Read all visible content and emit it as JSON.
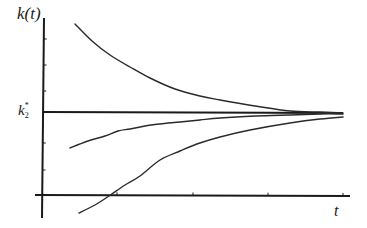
{
  "chart_data": {
    "type": "line",
    "title": "",
    "xlabel": "t",
    "ylabel": "k(t)",
    "reference_line": {
      "label_base": "k",
      "label_sub": "2",
      "label_sup": "*",
      "y_pixel": 112
    },
    "grid": false,
    "legend": null,
    "axis": {
      "x_axis": {
        "x1": 35,
        "y1": 195,
        "x2": 350,
        "y2": 196
      },
      "y_axis": {
        "x1": 44,
        "y1": 18,
        "x2": 42,
        "y2": 218
      },
      "x_ticks_px": [
        117,
        193,
        268,
        343
      ],
      "y_ticks_px": [
        39,
        65,
        91,
        143,
        170
      ]
    },
    "series": [
      {
        "name": "above-steady-state path",
        "points_px": [
          [
            75,
            24
          ],
          [
            92,
            41
          ],
          [
            110,
            55
          ],
          [
            130,
            67
          ],
          [
            150,
            78
          ],
          [
            175,
            89
          ],
          [
            200,
            96
          ],
          [
            220,
            100
          ],
          [
            255,
            106
          ],
          [
            290,
            111
          ],
          [
            320,
            112
          ],
          [
            343,
            113
          ]
        ]
      },
      {
        "name": "below-steady-state path (near)",
        "points_px": [
          [
            70,
            148
          ],
          [
            88,
            141
          ],
          [
            105,
            136
          ],
          [
            118,
            131
          ],
          [
            130,
            129
          ],
          [
            145,
            126
          ],
          [
            160,
            124
          ],
          [
            180,
            122
          ],
          [
            200,
            120
          ],
          [
            220,
            118
          ],
          [
            255,
            116
          ],
          [
            290,
            115
          ],
          [
            320,
            114
          ],
          [
            343,
            114
          ]
        ]
      },
      {
        "name": "below-steady-state path (far)",
        "points_px": [
          [
            79,
            213
          ],
          [
            95,
            205
          ],
          [
            109,
            196
          ],
          [
            125,
            185
          ],
          [
            140,
            176
          ],
          [
            160,
            160
          ],
          [
            180,
            151
          ],
          [
            200,
            143
          ],
          [
            220,
            137
          ],
          [
            250,
            130
          ],
          [
            290,
            123
          ],
          [
            320,
            119
          ],
          [
            343,
            117
          ]
        ]
      }
    ],
    "ylim": [
      0,
      null
    ],
    "note": "All trajectories converge to the steady-state k2* as t increases"
  },
  "labels": {
    "y_axis": "k(t)",
    "x_axis": "t",
    "kstar_base": "k",
    "kstar_sub": "2",
    "kstar_sup": "*"
  }
}
